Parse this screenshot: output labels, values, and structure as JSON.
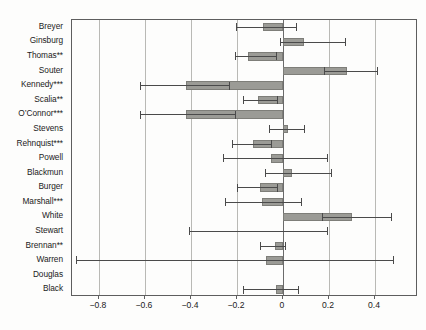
{
  "chart_data": {
    "type": "bar",
    "orientation": "horizontal",
    "title": "",
    "subtitle": "",
    "xlabel": "",
    "ylabel": "",
    "xlim": [
      -0.917,
      0.587
    ],
    "ylim": null,
    "grid": true,
    "gridlines_x": [
      -0.8,
      -0.6,
      -0.4,
      -0.2,
      0,
      0.2,
      0.4
    ],
    "zero_reference_line": 0,
    "legend": null,
    "legend_position": "none",
    "error_bars": "confidence interval",
    "xticks": [
      -0.8,
      -0.6,
      -0.4,
      -0.2,
      0,
      0.2,
      0.4
    ],
    "xticklabels": [
      "−0.8",
      "−0.6",
      "−0.4",
      "−0.2",
      "0",
      "0.2",
      "0.4"
    ],
    "categories": [
      "Breyer",
      "Ginsburg",
      "Thomas**",
      "Souter",
      "Kennedy***",
      "Scalia**",
      "O’Connor***",
      "Stevens",
      "Rehnquist***",
      "Powell",
      "Blackmun",
      "Burger",
      "Marshall***",
      "White",
      "Stewart",
      "Brennan**",
      "Warren",
      "Douglas",
      "Black"
    ],
    "values": [
      -0.085,
      0.09,
      -0.15,
      0.28,
      -0.42,
      -0.11,
      -0.42,
      0.02,
      -0.13,
      -0.05,
      0.04,
      -0.1,
      -0.09,
      0.3,
      0.0,
      -0.035,
      -0.075,
      0.0,
      -0.03
    ],
    "ci_low": [
      -0.205,
      -0.015,
      -0.21,
      0.18,
      -0.62,
      -0.175,
      -0.62,
      -0.06,
      -0.22,
      -0.26,
      -0.08,
      -0.2,
      -0.25,
      0.17,
      -0.41,
      -0.1,
      -0.9,
      0.0,
      -0.175
    ],
    "ci_high": [
      0.055,
      0.27,
      -0.03,
      0.41,
      -0.235,
      -0.025,
      -0.21,
      0.09,
      -0.05,
      0.19,
      0.21,
      -0.025,
      0.08,
      0.47,
      0.19,
      0.01,
      0.48,
      0.0,
      0.065
    ],
    "annotations": [
      "** and *** suffixes on justice names denote statistical significance levels"
    ],
    "colors": {
      "bar_fill": "#9b9b96",
      "bar_edge": "#7e7e79",
      "error_bar": "#4a4a4a",
      "gridline": "#b9b9b5",
      "zero_line": "#6b6b6b",
      "frame": "#5e5e5e",
      "text": "#1b1b1b",
      "background": "#fdfdfc"
    }
  }
}
